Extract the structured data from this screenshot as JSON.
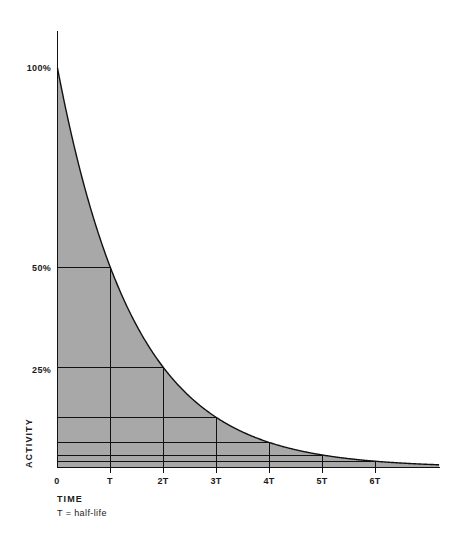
{
  "chart_data": {
    "type": "area",
    "title": "",
    "xlabel": "TIME",
    "ylabel": "ACTIVITY",
    "note": "T = half-life",
    "x": [
      0,
      1,
      2,
      3,
      4,
      5,
      6,
      7
    ],
    "values": [
      100,
      50,
      25,
      12.5,
      6.25,
      3.125,
      1.5625,
      0.78125
    ],
    "unit": "%",
    "x_tick_labels": [
      "0",
      "T",
      "2T",
      "3T",
      "4T",
      "5T",
      "6T"
    ],
    "y_tick_labels": [
      "100%",
      "50%",
      "25%"
    ],
    "y_tick_values": [
      100,
      50,
      25
    ],
    "gridline_values": [
      50,
      25,
      12.5,
      6.25,
      3.125,
      1.5625
    ],
    "xlim": [
      0,
      7.2
    ],
    "ylim": [
      0,
      100
    ],
    "grid": true,
    "legend": "none",
    "curve_equation": "A = 100 * 2^(-t/T)",
    "fill_color": "#a8a8a8",
    "line_color": "#111111",
    "background_color": "#ffffff"
  },
  "labels": {
    "y_100": "100%",
    "y_50": "50%",
    "y_25": "25%",
    "x_0": "0",
    "x_1": "T",
    "x_2": "2T",
    "x_3": "3T",
    "x_4": "4T",
    "x_5": "5T",
    "x_6": "6T",
    "axis_x_title": "TIME",
    "axis_y_title": "ACTIVITY",
    "footnote": "T = half-life"
  }
}
